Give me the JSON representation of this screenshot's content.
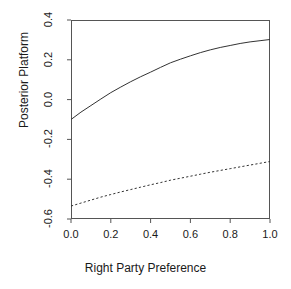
{
  "chart_data": {
    "type": "line",
    "title": "",
    "xlabel": "Right Party Preference",
    "ylabel": "Posterior Platform",
    "xlim": [
      0.0,
      1.0
    ],
    "ylim": [
      -0.6,
      0.4
    ],
    "xticks": [
      "0.0",
      "0.2",
      "0.4",
      "0.6",
      "0.8",
      "1.0"
    ],
    "xtick_values": [
      0.0,
      0.2,
      0.4,
      0.6,
      0.8,
      1.0
    ],
    "yticks": [
      "0.4",
      "0.2",
      "0.0",
      "-0.2",
      "-0.4",
      "-0.6"
    ],
    "ytick_values": [
      0.4,
      0.2,
      0.0,
      -0.2,
      -0.4,
      -0.6
    ],
    "grid": false,
    "legend": "none",
    "x": [
      0.0,
      0.05,
      0.1,
      0.15,
      0.2,
      0.25,
      0.3,
      0.35,
      0.4,
      0.45,
      0.5,
      0.55,
      0.6,
      0.65,
      0.7,
      0.75,
      0.8,
      0.85,
      0.9,
      0.95,
      1.0
    ],
    "series": [
      {
        "name": "solid-curve",
        "style": "solid",
        "color": "#333333",
        "values": [
          -0.1,
          -0.063,
          -0.03,
          0.003,
          0.035,
          0.063,
          0.09,
          0.115,
          0.138,
          0.162,
          0.185,
          0.203,
          0.22,
          0.236,
          0.25,
          0.262,
          0.272,
          0.282,
          0.29,
          0.296,
          0.302
        ]
      },
      {
        "name": "dashed-curve",
        "style": "dashed",
        "color": "#333333",
        "values": [
          -0.535,
          -0.52,
          -0.505,
          -0.49,
          -0.477,
          -0.464,
          -0.452,
          -0.44,
          -0.428,
          -0.417,
          -0.405,
          -0.395,
          -0.385,
          -0.375,
          -0.365,
          -0.356,
          -0.347,
          -0.338,
          -0.329,
          -0.32,
          -0.311
        ]
      }
    ]
  },
  "axis": {
    "x_label": "Right Party Preference",
    "y_label": "Posterior Platform"
  }
}
